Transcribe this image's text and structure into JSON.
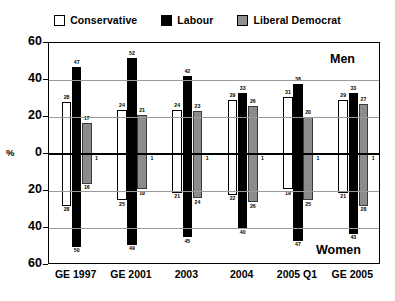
{
  "legend": {
    "entries": [
      {
        "label": "Conservative",
        "icon": "square-outline-icon",
        "color": "#ffffff"
      },
      {
        "label": "Labour",
        "icon": "square-filled-icon",
        "color": "#000000"
      },
      {
        "label": "Liberal Democrat",
        "icon": "square-grey-icon",
        "color": "#8f8f8f"
      }
    ]
  },
  "axis": {
    "ylabel": "%",
    "yticks_top": [
      "60",
      "40",
      "20",
      "0"
    ],
    "yticks_bottom": [
      "20",
      "40",
      "60"
    ],
    "ylim": [
      -60,
      60
    ]
  },
  "panels": {
    "top_caption": "Men",
    "bottom_caption": "Women"
  },
  "chart_data": {
    "type": "bar",
    "title": "",
    "xlabel": "",
    "ylabel": "%",
    "ylim": [
      -60,
      60
    ],
    "grid": true,
    "legend_position": "top",
    "orientation": "vertical-diverging",
    "categories": [
      "GE 1997",
      "GE 2001",
      "2003",
      "2004",
      "2005 Q1",
      "GE 2005"
    ],
    "panels": [
      "Men",
      "Women"
    ],
    "series": [
      {
        "name": "Conservative",
        "panel": "Men",
        "values": [
          28,
          24,
          24,
          29,
          31,
          29
        ]
      },
      {
        "name": "Labour",
        "panel": "Men",
        "values": [
          47,
          52,
          42,
          33,
          38,
          33
        ]
      },
      {
        "name": "Liberal Democrat",
        "panel": "Men",
        "values": [
          17,
          21,
          23,
          26,
          20,
          27
        ]
      },
      {
        "name": "Conservative",
        "panel": "Women",
        "values": [
          28,
          25,
          21,
          22,
          19,
          21
        ]
      },
      {
        "name": "Labour",
        "panel": "Women",
        "values": [
          50,
          49,
          45,
          40,
          47,
          43
        ]
      },
      {
        "name": "Liberal Democrat",
        "panel": "Women",
        "values": [
          16,
          19,
          24,
          26,
          25,
          28
        ]
      }
    ]
  }
}
